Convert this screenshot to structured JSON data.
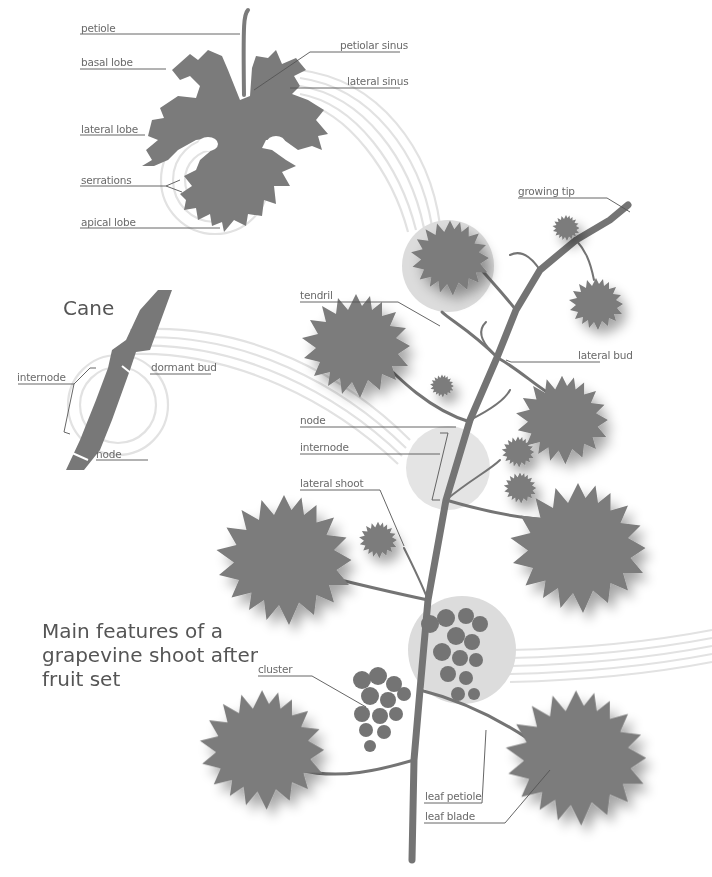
{
  "colors": {
    "leaf": "#7b7b7b",
    "stem": "#747474",
    "halo": "#dcdcdc",
    "arc": "#e2e2e2",
    "leader": "#555555",
    "label_text": "#6a6a6a",
    "title_text": "#555555",
    "background": "#ffffff"
  },
  "leaf_diagram": {
    "labels": {
      "petiole": "petiole",
      "basal_lobe": "basal lobe",
      "lateral_lobe": "lateral lobe",
      "serrations": "serrations",
      "apical_lobe": "apical lobe",
      "petiolar_sinus": "petiolar sinus",
      "lateral_sinus": "lateral sinus"
    }
  },
  "cane_diagram": {
    "title": "Cane",
    "labels": {
      "internode": "internode",
      "dormant_bud": "dormant bud",
      "node": "node"
    }
  },
  "shoot_diagram": {
    "title": "Main features of a grapevine shoot after fruit set",
    "labels": {
      "growing_tip": "growing tip",
      "tendril": "tendril",
      "lateral_bud": "lateral bud",
      "node": "node",
      "internode": "internode",
      "lateral_shoot": "lateral shoot",
      "cluster": "cluster",
      "leaf_petiole": "leaf petiole",
      "leaf_blade": "leaf blade"
    }
  }
}
